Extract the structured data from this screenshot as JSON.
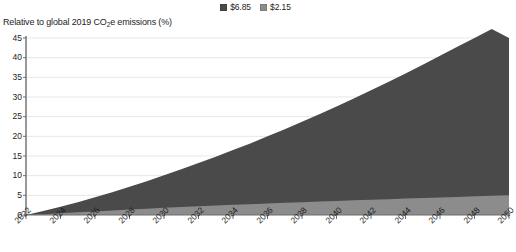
{
  "legend": {
    "position": "top-center",
    "items": [
      {
        "label": "$6.85",
        "color": "#4a4a4a",
        "name": "legend-series-685"
      },
      {
        "label": "$2.15",
        "color": "#8c8c8c",
        "name": "legend-series-215"
      }
    ]
  },
  "axis_title": {
    "prefix": "Relative to global 2019 CO",
    "sub": "2",
    "suffix": "e emissions (%)",
    "full": "Relative to global 2019 CO2e emissions (%)"
  },
  "chart_data": {
    "type": "area",
    "stacked": true,
    "title": "",
    "subtitle": "",
    "xlabel": "",
    "ylabel": "Relative to global 2019 CO2e emissions (%)",
    "x": [
      2022,
      2023,
      2024,
      2025,
      2026,
      2027,
      2028,
      2029,
      2030,
      2031,
      2032,
      2033,
      2034,
      2035,
      2036,
      2037,
      2038,
      2039,
      2040,
      2041,
      2042,
      2043,
      2044,
      2045,
      2046,
      2047,
      2048,
      2049,
      2050
    ],
    "xticks": [
      2022,
      2024,
      2026,
      2028,
      2030,
      2032,
      2034,
      2036,
      2038,
      2040,
      2042,
      2044,
      2046,
      2048,
      2050
    ],
    "yticks": [
      0,
      5,
      10,
      15,
      20,
      25,
      30,
      35,
      40,
      45
    ],
    "ylim": [
      0,
      45
    ],
    "xlim": [
      2022,
      2050
    ],
    "grid": true,
    "grid_axis": "y",
    "series": [
      {
        "name": "$2.15",
        "color": "#8c8c8c",
        "values": [
          0.0,
          0.22,
          0.45,
          0.68,
          0.92,
          1.15,
          1.38,
          1.6,
          1.82,
          2.02,
          2.22,
          2.4,
          2.58,
          2.76,
          2.93,
          3.1,
          3.26,
          3.42,
          3.58,
          3.73,
          3.88,
          4.03,
          4.18,
          4.32,
          4.46,
          4.6,
          4.74,
          4.87,
          5.0
        ]
      },
      {
        "name": "$6.85",
        "color": "#4a4a4a",
        "values": [
          0.0,
          0.78,
          1.65,
          2.57,
          3.58,
          4.65,
          5.82,
          7.0,
          8.28,
          9.58,
          10.98,
          12.4,
          13.92,
          15.44,
          17.07,
          18.7,
          20.44,
          22.18,
          24.02,
          25.87,
          27.82,
          29.77,
          31.82,
          33.88,
          36.04,
          38.2,
          40.26,
          42.43,
          40.0
        ]
      }
    ],
    "series_totals": {
      "note": "stacked totals (light + dark)",
      "values": [
        0.0,
        1.0,
        2.1,
        3.25,
        4.5,
        5.8,
        7.2,
        8.6,
        10.1,
        11.6,
        13.2,
        14.8,
        16.5,
        18.2,
        20.0,
        21.8,
        23.7,
        25.6,
        27.6,
        29.6,
        31.7,
        33.8,
        36.0,
        38.2,
        40.5,
        42.8,
        45.0,
        47.3,
        45.0
      ]
    }
  }
}
